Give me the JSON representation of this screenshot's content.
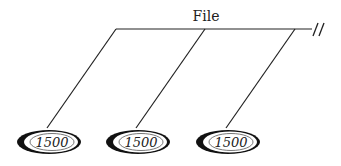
{
  "diagram": {
    "title": "File",
    "continuation_mark": "//",
    "nodes": [
      {
        "label": "1500"
      },
      {
        "label": "1500"
      },
      {
        "label": "1500"
      }
    ]
  }
}
